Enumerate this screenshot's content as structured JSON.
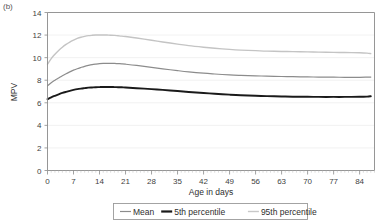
{
  "figure": {
    "panel_label": "(b)"
  },
  "chart_data": {
    "type": "line",
    "title": "",
    "xlabel": "Age in days",
    "ylabel": "MPV",
    "xlim": [
      0,
      88
    ],
    "ylim": [
      0,
      14
    ],
    "xticks": [
      0,
      7,
      14,
      21,
      28,
      35,
      42,
      49,
      56,
      63,
      70,
      77,
      84
    ],
    "yticks": [
      0,
      2,
      4,
      6,
      8,
      10,
      12,
      14
    ],
    "xtick_labels": [
      "0",
      "7",
      "14",
      "21",
      "28",
      "35",
      "42",
      "49",
      "56",
      "63",
      "70",
      "77",
      "84"
    ],
    "ytick_labels": [
      "0",
      "2",
      "4",
      "6",
      "8",
      "10",
      "12",
      "14"
    ],
    "grid": true,
    "grid_axis": "y",
    "legend_position": "below-center",
    "minor_ticks_x": true,
    "x": [
      0,
      1,
      2,
      3,
      4,
      5,
      6,
      7,
      8,
      9,
      10,
      11,
      12,
      13,
      14,
      15,
      16,
      17,
      18,
      19,
      20,
      21,
      24,
      28,
      31,
      35,
      38,
      42,
      45,
      49,
      52,
      56,
      59,
      63,
      66,
      70,
      73,
      77,
      80,
      84,
      86,
      87
    ],
    "series": [
      {
        "name": "Mean",
        "color": "#8c8c8c",
        "width": 1.2,
        "values": [
          7.5,
          7.78,
          8.0,
          8.2,
          8.4,
          8.58,
          8.74,
          8.89,
          9.02,
          9.13,
          9.23,
          9.31,
          9.38,
          9.43,
          9.47,
          9.49,
          9.5,
          9.5,
          9.49,
          9.47,
          9.45,
          9.42,
          9.31,
          9.14,
          9.01,
          8.85,
          8.74,
          8.62,
          8.55,
          8.47,
          8.43,
          8.39,
          8.36,
          8.33,
          8.31,
          8.29,
          8.28,
          8.27,
          8.26,
          8.26,
          8.27,
          8.28
        ]
      },
      {
        "name": "5th percentile",
        "color": "#1a1a1a",
        "width": 1.9,
        "values": [
          6.32,
          6.48,
          6.62,
          6.75,
          6.87,
          6.97,
          7.06,
          7.14,
          7.21,
          7.26,
          7.3,
          7.34,
          7.36,
          7.38,
          7.39,
          7.4,
          7.4,
          7.4,
          7.39,
          7.38,
          7.37,
          7.35,
          7.29,
          7.21,
          7.14,
          7.04,
          6.96,
          6.87,
          6.8,
          6.72,
          6.67,
          6.62,
          6.59,
          6.56,
          6.54,
          6.53,
          6.52,
          6.52,
          6.52,
          6.53,
          6.55,
          6.58
        ]
      },
      {
        "name": "95th percentile",
        "color": "#c4c4c4",
        "width": 1.4,
        "values": [
          9.42,
          9.92,
          10.3,
          10.63,
          10.92,
          11.17,
          11.38,
          11.55,
          11.7,
          11.81,
          11.89,
          11.95,
          11.98,
          12.0,
          12.01,
          12.01,
          12.0,
          11.99,
          11.97,
          11.94,
          11.91,
          11.87,
          11.74,
          11.54,
          11.39,
          11.2,
          11.06,
          10.92,
          10.83,
          10.73,
          10.67,
          10.62,
          10.58,
          10.55,
          10.53,
          10.51,
          10.49,
          10.47,
          10.45,
          10.43,
          10.4,
          10.36
        ]
      }
    ],
    "legend": [
      {
        "label": "Mean",
        "color": "#8c8c8c",
        "width": 1.2
      },
      {
        "label": "5th percentile",
        "color": "#1a1a1a",
        "width": 2.2
      },
      {
        "label": "95th percentile",
        "color": "#c8c8c8",
        "width": 1.4
      }
    ]
  }
}
